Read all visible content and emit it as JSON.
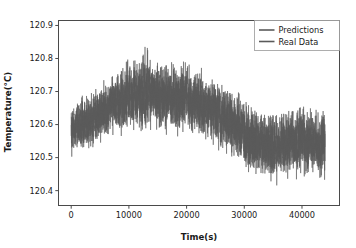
{
  "chart_data": {
    "type": "line",
    "title": "",
    "xlabel": "Time(s)",
    "ylabel": "Temperature(°C)",
    "xlim": [
      -2200,
      46500
    ],
    "ylim": [
      120.355,
      120.915
    ],
    "xticks": [
      0,
      10000,
      20000,
      30000,
      40000
    ],
    "xticklabels": [
      "0",
      "10000",
      "20000",
      "30000",
      "40000"
    ],
    "yticks": [
      120.4,
      120.5,
      120.6,
      120.7,
      120.8,
      120.9
    ],
    "yticklabels": [
      "120.4",
      "120.5",
      "120.6",
      "120.7",
      "120.8",
      "120.9"
    ],
    "grid": false,
    "legend_position": "upper right",
    "series": [
      {
        "name": "Predictions",
        "color": "#5a5a5a",
        "description": "Noisy thermal signal overlapping almost exactly with the measured data; rises from ~120.58 at t=0 to a broad plateau near 120.72 between t=9000 and t=22000, with a narrow spike reaching 120.87 near t=12400, then decays to ~120.55 after t=30000 and trends to ~120.52 by t=44000.",
        "envelope": [
          {
            "t": 0,
            "low": 120.5,
            "high": 120.66,
            "mean": 120.585
          },
          {
            "t": 2000,
            "low": 120.515,
            "high": 120.69,
            "mean": 120.6
          },
          {
            "t": 4000,
            "low": 120.53,
            "high": 120.715,
            "mean": 120.62
          },
          {
            "t": 6000,
            "low": 120.545,
            "high": 120.74,
            "mean": 120.645
          },
          {
            "t": 8000,
            "low": 120.56,
            "high": 120.775,
            "mean": 120.665
          },
          {
            "t": 10000,
            "low": 120.57,
            "high": 120.8,
            "mean": 120.685
          },
          {
            "t": 12000,
            "low": 120.575,
            "high": 120.81,
            "mean": 120.695
          },
          {
            "t": 12400,
            "low": 120.58,
            "high": 120.87,
            "mean": 120.7
          },
          {
            "t": 14000,
            "low": 120.575,
            "high": 120.805,
            "mean": 120.692
          },
          {
            "t": 16000,
            "low": 120.57,
            "high": 120.8,
            "mean": 120.688
          },
          {
            "t": 18000,
            "low": 120.565,
            "high": 120.795,
            "mean": 120.682
          },
          {
            "t": 20000,
            "low": 120.56,
            "high": 120.79,
            "mean": 120.675
          },
          {
            "t": 22000,
            "low": 120.55,
            "high": 120.78,
            "mean": 120.665
          },
          {
            "t": 24000,
            "low": 120.535,
            "high": 120.765,
            "mean": 120.65
          },
          {
            "t": 26000,
            "low": 120.515,
            "high": 120.745,
            "mean": 120.63
          },
          {
            "t": 28000,
            "low": 120.49,
            "high": 120.72,
            "mean": 120.605
          },
          {
            "t": 30000,
            "low": 120.45,
            "high": 120.68,
            "mean": 120.57
          },
          {
            "t": 32000,
            "low": 120.41,
            "high": 120.64,
            "mean": 120.545
          },
          {
            "t": 34000,
            "low": 120.4,
            "high": 120.63,
            "mean": 120.538
          },
          {
            "t": 36000,
            "low": 120.405,
            "high": 120.635,
            "mean": 120.54
          },
          {
            "t": 38000,
            "low": 120.41,
            "high": 120.645,
            "mean": 120.545
          },
          {
            "t": 40000,
            "low": 120.415,
            "high": 120.655,
            "mean": 120.55
          },
          {
            "t": 42000,
            "low": 120.42,
            "high": 120.65,
            "mean": 120.548
          },
          {
            "t": 44000,
            "low": 120.415,
            "high": 120.645,
            "mean": 120.542
          }
        ]
      },
      {
        "name": "Real Data",
        "color": "#5a5a5a",
        "description": "Measured temperature trace, visually indistinguishable from the predictions at this scale.",
        "envelope": [
          {
            "t": 0,
            "low": 120.505,
            "high": 120.655,
            "mean": 120.588
          },
          {
            "t": 2000,
            "low": 120.518,
            "high": 120.688,
            "mean": 120.602
          },
          {
            "t": 4000,
            "low": 120.532,
            "high": 120.712,
            "mean": 120.622
          },
          {
            "t": 6000,
            "low": 120.548,
            "high": 120.738,
            "mean": 120.647
          },
          {
            "t": 8000,
            "low": 120.562,
            "high": 120.772,
            "mean": 120.667
          },
          {
            "t": 10000,
            "low": 120.572,
            "high": 120.798,
            "mean": 120.686
          },
          {
            "t": 12000,
            "low": 120.577,
            "high": 120.808,
            "mean": 120.696
          },
          {
            "t": 12400,
            "low": 120.582,
            "high": 120.865,
            "mean": 120.701
          },
          {
            "t": 14000,
            "low": 120.576,
            "high": 120.803,
            "mean": 120.693
          },
          {
            "t": 16000,
            "low": 120.571,
            "high": 120.798,
            "mean": 120.689
          },
          {
            "t": 18000,
            "low": 120.566,
            "high": 120.793,
            "mean": 120.683
          },
          {
            "t": 20000,
            "low": 120.561,
            "high": 120.788,
            "mean": 120.676
          },
          {
            "t": 22000,
            "low": 120.551,
            "high": 120.778,
            "mean": 120.666
          },
          {
            "t": 24000,
            "low": 120.536,
            "high": 120.763,
            "mean": 120.651
          },
          {
            "t": 26000,
            "low": 120.516,
            "high": 120.743,
            "mean": 120.631
          },
          {
            "t": 28000,
            "low": 120.492,
            "high": 120.718,
            "mean": 120.606
          },
          {
            "t": 30000,
            "low": 120.452,
            "high": 120.678,
            "mean": 120.571
          },
          {
            "t": 32000,
            "low": 120.412,
            "high": 120.638,
            "mean": 120.546
          },
          {
            "t": 34000,
            "low": 120.402,
            "high": 120.628,
            "mean": 120.539
          },
          {
            "t": 36000,
            "low": 120.407,
            "high": 120.633,
            "mean": 120.541
          },
          {
            "t": 38000,
            "low": 120.412,
            "high": 120.643,
            "mean": 120.546
          },
          {
            "t": 40000,
            "low": 120.417,
            "high": 120.653,
            "mean": 120.551
          },
          {
            "t": 42000,
            "low": 120.422,
            "high": 120.648,
            "mean": 120.549
          },
          {
            "t": 44000,
            "low": 120.417,
            "high": 120.643,
            "mean": 120.543
          }
        ]
      }
    ]
  },
  "legend": {
    "entries": [
      {
        "label": "Predictions"
      },
      {
        "label": "Real Data"
      }
    ]
  },
  "axes": {
    "x_title": "Time(s)",
    "y_title": "Temperature(°C)"
  },
  "colors": {
    "series": "#5a5a5a",
    "spine": "#4a4a4a",
    "text": "#1a1a1a",
    "background": "#ffffff"
  }
}
